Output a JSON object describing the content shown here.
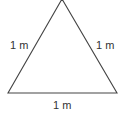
{
  "diagram": {
    "shape": "equilateral-triangle",
    "stroke_color": "#444444",
    "labels": {
      "left_side": "1 m",
      "right_side": "1 m",
      "bottom_side": "1 m"
    }
  }
}
